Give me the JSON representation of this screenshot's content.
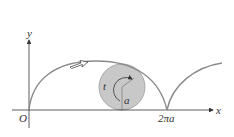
{
  "diagram": {
    "type": "cycloid",
    "labels": {
      "y_axis": "y",
      "x_axis": "x",
      "origin": "O",
      "cusp": "2πa",
      "angle": "t",
      "radius": "a"
    },
    "colors": {
      "curve": "#8a8a8a",
      "circle_fill": "#c8c8c8",
      "circle_stroke": "#9a9a9a",
      "axis": "#333333"
    }
  }
}
